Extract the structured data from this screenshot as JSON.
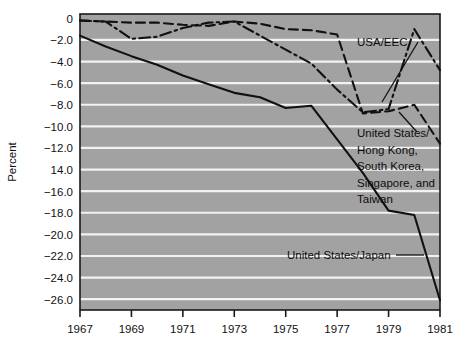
{
  "figure": {
    "background_color": "#ffffff",
    "plot_background_color": "#a2a2a2",
    "gridline_color": "#f2f2f2",
    "axis_color": "#1a1a1a",
    "line_color": "#111111"
  },
  "axes": {
    "ylabel": "Percent",
    "y_ticks": [
      "0",
      "−2.0",
      "−4.0",
      "−6.0",
      "−8.0",
      "−10.0",
      "−12.0",
      "14.0",
      "−16.0",
      "−18.0",
      "−20.0",
      "−22.0",
      "−24.0",
      "−26.0"
    ],
    "x_ticks": [
      "1967",
      "1969",
      "1971",
      "1973",
      "1975",
      "1977",
      "1979",
      "1981"
    ]
  },
  "annotations": {
    "usa_eec": "USA/EEC",
    "nics_line1": "United States/",
    "nics_line2": "Hong Kong,",
    "nics_line3": "South Korea,",
    "nics_line4": "Singapore, and",
    "nics_line5": "Taiwan",
    "japan": "United States/Japan"
  },
  "chart_data": {
    "type": "line",
    "title": "",
    "xlabel": "",
    "ylabel": "Percent",
    "xlim": [
      1967,
      1981
    ],
    "ylim": [
      -27.0,
      0.4
    ],
    "ytick_values": [
      0,
      -2,
      -4,
      -6,
      -8,
      -10,
      -12,
      -14,
      -16,
      -18,
      -20,
      -22,
      -24,
      -26
    ],
    "ytick_labels": [
      "0",
      "-2.0",
      "-4.0",
      "-6.0",
      "-8.0",
      "-10.0",
      "-12.0",
      "14.0",
      "-16.0",
      "-18.0",
      "-20.0",
      "-22.0",
      "-24.0",
      "-26.0"
    ],
    "xtick_values": [
      1967,
      1969,
      1971,
      1973,
      1975,
      1977,
      1979,
      1981
    ],
    "grid": "horizontal",
    "legend_position": "inline-annotations",
    "x": [
      1967,
      1968,
      1969,
      1970,
      1971,
      1972,
      1973,
      1974,
      1975,
      1976,
      1977,
      1978,
      1979,
      1980,
      1981
    ],
    "series": [
      {
        "name": "USA/EEC",
        "style": "dash-dot",
        "values": [
          -0.2,
          -0.3,
          -1.9,
          -1.7,
          -0.9,
          -0.4,
          -0.3,
          -1.6,
          -2.9,
          -4.2,
          -6.6,
          -8.7,
          -8.4,
          -1.0,
          -4.8
        ]
      },
      {
        "name": "United States/Hong Kong, South Korea, Singapore, and Taiwan",
        "style": "dashed",
        "values": [
          -0.2,
          -0.3,
          -0.4,
          -0.4,
          -0.6,
          -0.7,
          -0.3,
          -0.5,
          -1.0,
          -1.1,
          -1.5,
          -8.8,
          -8.6,
          -8.0,
          -11.6
        ]
      },
      {
        "name": "United States/Japan",
        "style": "solid",
        "values": [
          -1.6,
          -2.6,
          -3.5,
          -4.3,
          -5.3,
          -6.1,
          -6.9,
          -7.3,
          -8.3,
          -8.1,
          -11.2,
          -14.3,
          -17.8,
          -18.2,
          -26.1
        ]
      }
    ]
  }
}
